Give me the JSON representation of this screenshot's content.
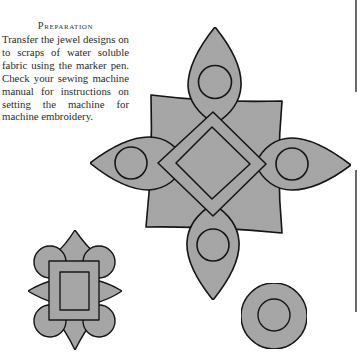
{
  "section": {
    "heading": "Preparation",
    "body": "Transfer the jewel designs on to scraps of water soluble fabric using the marker pen. Check your sewing machine manual for instructions on setting the machine for machine embroidery."
  },
  "designs": [
    {
      "name": "large-cross-jewel",
      "elements": [
        "four pointed petals with circles",
        "outer diamond",
        "inner diamond",
        "concave square backing"
      ]
    },
    {
      "name": "small-rectangle-jewel",
      "elements": [
        "four corner circles",
        "four points",
        "outer rectangle",
        "inner rectangle"
      ]
    },
    {
      "name": "round-jewel",
      "elements": [
        "outer circle",
        "inner circle"
      ]
    }
  ],
  "colors": {
    "fill": "#a8a8a8",
    "stroke": "#1a1a1a",
    "text": "#2b2b2b",
    "background": "#ffffff"
  }
}
